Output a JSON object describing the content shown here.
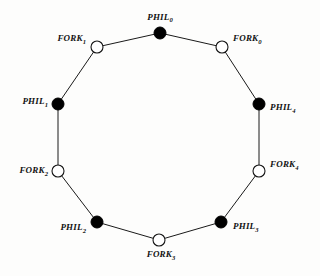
{
  "figure": {
    "kind": "ring-graph",
    "background_color": "#fdfdfc",
    "edge_color": "#1a1a1a",
    "phil_fill": "#000000",
    "fork_fill": "#ffffff",
    "node_stroke": "#141414"
  },
  "nodes": [
    {
      "id": "PHIL_0",
      "type": "philosopher",
      "base": "PHIL",
      "subscript": "0",
      "filled": true,
      "cx": 160,
      "cy": 33,
      "r": 6,
      "label_x": 160,
      "label_y": 24,
      "label_anchor": "center"
    },
    {
      "id": "FORK_0",
      "type": "fork",
      "base": "FORK",
      "subscript": "0",
      "filled": false,
      "cx": 222,
      "cy": 47,
      "r": 6,
      "label_x": 233,
      "label_y": 40,
      "label_anchor": "right"
    },
    {
      "id": "PHIL_4",
      "type": "philosopher",
      "base": "PHIL",
      "subscript": "4",
      "filled": true,
      "cx": 259,
      "cy": 104,
      "r": 6,
      "label_x": 270,
      "label_y": 109,
      "label_anchor": "right"
    },
    {
      "id": "FORK_4",
      "type": "fork",
      "base": "FORK",
      "subscript": "4",
      "filled": false,
      "cx": 259,
      "cy": 171,
      "r": 6,
      "label_x": 270,
      "label_y": 166,
      "label_anchor": "right"
    },
    {
      "id": "PHIL_3",
      "type": "philosopher",
      "base": "PHIL",
      "subscript": "3",
      "filled": true,
      "cx": 221,
      "cy": 222,
      "r": 6,
      "label_x": 233,
      "label_y": 228,
      "label_anchor": "right"
    },
    {
      "id": "FORK_3",
      "type": "fork",
      "base": "FORK",
      "subscript": "3",
      "filled": false,
      "cx": 159,
      "cy": 240,
      "r": 6,
      "label_x": 161,
      "label_y": 250,
      "label_anchor": "below"
    },
    {
      "id": "PHIL_2",
      "type": "philosopher",
      "base": "PHIL",
      "subscript": "2",
      "filled": true,
      "cx": 97,
      "cy": 222,
      "r": 6,
      "label_x": 86,
      "label_y": 229,
      "label_anchor": "left"
    },
    {
      "id": "FORK_2",
      "type": "fork",
      "base": "FORK",
      "subscript": "2",
      "filled": false,
      "cx": 58,
      "cy": 171,
      "r": 6,
      "label_x": 48,
      "label_y": 172,
      "label_anchor": "left"
    },
    {
      "id": "PHIL_1",
      "type": "philosopher",
      "base": "PHIL",
      "subscript": "1",
      "filled": true,
      "cx": 58,
      "cy": 104,
      "r": 6,
      "label_x": 48,
      "label_y": 103,
      "label_anchor": "left"
    },
    {
      "id": "FORK_1",
      "type": "fork",
      "base": "FORK",
      "subscript": "1",
      "filled": false,
      "cx": 97,
      "cy": 47,
      "r": 6,
      "label_x": 86,
      "label_y": 40,
      "label_anchor": "left"
    }
  ],
  "edges": [
    {
      "id": "edge-phil0-fork0",
      "from": "PHIL_0",
      "to": "FORK_0",
      "x1": 160,
      "y1": 33,
      "x2": 222,
      "y2": 47
    },
    {
      "id": "edge-fork0-phil4",
      "from": "FORK_0",
      "to": "PHIL_4",
      "x1": 222,
      "y1": 47,
      "x2": 259,
      "y2": 104
    },
    {
      "id": "edge-phil4-fork4",
      "from": "PHIL_4",
      "to": "FORK_4",
      "x1": 259,
      "y1": 104,
      "x2": 259,
      "y2": 171
    },
    {
      "id": "edge-fork4-phil3",
      "from": "FORK_4",
      "to": "PHIL_3",
      "x1": 259,
      "y1": 171,
      "x2": 221,
      "y2": 222
    },
    {
      "id": "edge-phil3-fork3",
      "from": "PHIL_3",
      "to": "FORK_3",
      "x1": 221,
      "y1": 222,
      "x2": 159,
      "y2": 240
    },
    {
      "id": "edge-fork3-phil2",
      "from": "FORK_3",
      "to": "PHIL_2",
      "x1": 159,
      "y1": 240,
      "x2": 97,
      "y2": 222
    },
    {
      "id": "edge-phil2-fork2",
      "from": "PHIL_2",
      "to": "FORK_2",
      "x1": 97,
      "y1": 222,
      "x2": 58,
      "y2": 171
    },
    {
      "id": "edge-fork2-phil1",
      "from": "FORK_2",
      "to": "PHIL_1",
      "x1": 58,
      "y1": 171,
      "x2": 58,
      "y2": 104
    },
    {
      "id": "edge-phil1-fork1",
      "from": "PHIL_1",
      "to": "FORK_1",
      "x1": 58,
      "y1": 104,
      "x2": 97,
      "y2": 47
    },
    {
      "id": "edge-fork1-phil0",
      "from": "FORK_1",
      "to": "PHIL_0",
      "x1": 97,
      "y1": 47,
      "x2": 160,
      "y2": 33
    }
  ]
}
